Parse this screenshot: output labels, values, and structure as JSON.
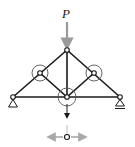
{
  "diagram": {
    "type": "truss",
    "load_label": "P",
    "colors": {
      "member": "#1a1a1a",
      "load_arrow": "#9a9a9a",
      "highlight_circle": "#555555",
      "force_arrow": "#1a1a1a",
      "reaction_arrows": "#a8a8a8"
    },
    "joints": [
      {
        "id": "left-support",
        "x": 13,
        "y": 97
      },
      {
        "id": "left-mid",
        "x": 40,
        "y": 73
      },
      {
        "id": "top",
        "x": 67,
        "y": 50
      },
      {
        "id": "right-mid",
        "x": 94,
        "y": 73
      },
      {
        "id": "right-support",
        "x": 120,
        "y": 97
      },
      {
        "id": "bottom-center",
        "x": 67,
        "y": 97
      }
    ],
    "supports": [
      {
        "joint": "left-support",
        "kind": "pin"
      },
      {
        "joint": "right-support",
        "kind": "roller"
      }
    ],
    "highlighted_joints": [
      "left-mid",
      "right-mid",
      "bottom-center"
    ],
    "free_body_joint": {
      "x": 67,
      "y": 137
    }
  }
}
